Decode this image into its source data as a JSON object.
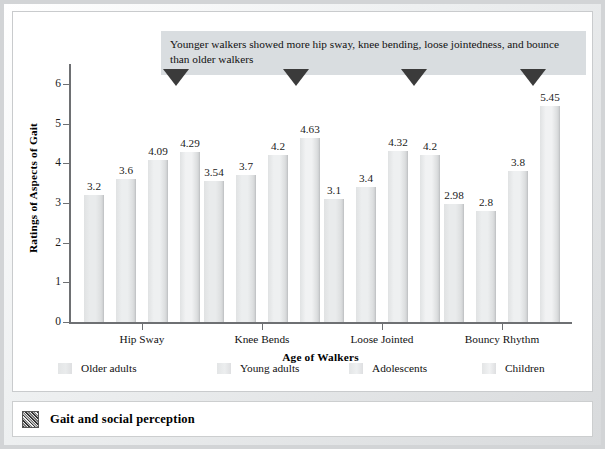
{
  "figure": {
    "caption": "Gait and social perception",
    "caption_icon": "thumbnail-image-icon"
  },
  "annotation": {
    "text": "Younger walkers showed more hip sway, knee bending, loose jointedness, and bounce than older walkers",
    "marker_icon": "down-triangle-marker",
    "marker_count": 4
  },
  "chart_data": {
    "type": "bar",
    "title": "",
    "xlabel": "Age of Walkers",
    "ylabel": "Ratings of Aspects of Gait",
    "ylim": [
      0,
      6.5
    ],
    "yticks": [
      0,
      1,
      2,
      3,
      4,
      5,
      6
    ],
    "ytick_labels": [
      "0",
      "1",
      "2",
      "3",
      "4",
      "5",
      "6"
    ],
    "grid": false,
    "legend_position": "bottom",
    "categories": [
      "Hip Sway",
      "Knee Bends",
      "Loose Jointed",
      "Bouncy Rhythm"
    ],
    "series": [
      {
        "name": "Older adults",
        "values": [
          3.2,
          3.54,
          3.1,
          2.98
        ],
        "labels": [
          "3.2",
          "3.54",
          "3.1",
          "2.98"
        ],
        "color": "#e9ebec"
      },
      {
        "name": "Young adults",
        "values": [
          3.6,
          3.7,
          3.4,
          2.8
        ],
        "labels": [
          "3.6",
          "3.7",
          "3.4",
          "2.8"
        ],
        "color": "#eceeef"
      },
      {
        "name": "Adolescents",
        "values": [
          4.09,
          4.2,
          4.32,
          3.8
        ],
        "labels": [
          "4.09",
          "4.2",
          "4.32",
          "3.8"
        ],
        "color": "#eef0f1"
      },
      {
        "name": "Children",
        "values": [
          4.29,
          4.63,
          4.2,
          5.45
        ],
        "labels": [
          "4.29",
          "4.63",
          "4.2",
          "5.45"
        ],
        "color": "#f1f2f3"
      }
    ]
  }
}
